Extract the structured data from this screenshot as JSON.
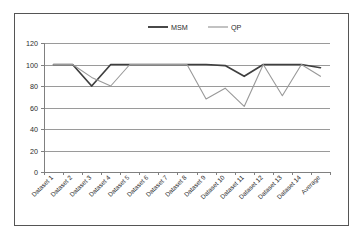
{
  "chart_data": {
    "type": "line",
    "title": "",
    "xlabel": "",
    "ylabel": "",
    "ylim": [
      0,
      120
    ],
    "ytick_step": 20,
    "yticks": [
      "0",
      "20",
      "40",
      "60",
      "80",
      "100",
      "120"
    ],
    "grid": "horizontal",
    "legend_position": "top-center",
    "categories": [
      "Dataset 1",
      "Dataset 2",
      "Dataset 3",
      "Dataset 4",
      "Dataset 5",
      "Dataset 6",
      "Dataset 7",
      "Dataset 8",
      "Dataset 9",
      "Dataset 10",
      "Dataset 11",
      "Dataset 12",
      "Dataset 13",
      "Dataset 14",
      "Average"
    ],
    "series": [
      {
        "name": "MSM",
        "color": "#3f3f3f",
        "values": [
          100,
          100,
          80,
          100,
          100,
          100,
          100,
          100,
          100,
          99,
          89,
          100,
          100,
          100,
          97
        ]
      },
      {
        "name": "QP",
        "color": "#999999",
        "values": [
          100,
          100,
          88,
          80,
          100,
          100,
          100,
          100,
          68,
          78,
          61,
          100,
          71,
          100,
          89
        ]
      }
    ]
  },
  "legend": {
    "entries": [
      {
        "label": "MSM"
      },
      {
        "label": "QP"
      }
    ]
  },
  "colors": {
    "series_msm": "#3f3f3f",
    "series_qp": "#999999",
    "gridline": "#9a9a9a",
    "axis": "#808080",
    "border": "#555555",
    "background": "#ffffff",
    "text": "#2b2b2b"
  }
}
